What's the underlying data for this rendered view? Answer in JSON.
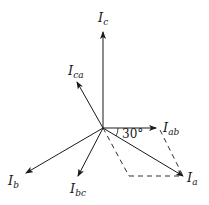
{
  "diagram": {
    "type": "phasor-diagram",
    "origin": [
      103,
      128
    ],
    "vectors": [
      {
        "name": "I_c",
        "main": "I",
        "sub": "c",
        "tip": [
          103,
          32
        ],
        "label_pos": [
          98,
          22
        ]
      },
      {
        "name": "I_ca",
        "main": "I",
        "sub": "ca",
        "tip": [
          77,
          82
        ],
        "label_pos": [
          68,
          75
        ]
      },
      {
        "name": "I_ab",
        "main": "I",
        "sub": "ab",
        "tip": [
          156,
          128
        ],
        "label_pos": [
          163,
          132
        ]
      },
      {
        "name": "I_a",
        "main": "I",
        "sub": "a",
        "tip": [
          183,
          176
        ],
        "label_pos": [
          187,
          182
        ]
      },
      {
        "name": "I_b",
        "main": "I",
        "sub": "b",
        "tip": [
          26,
          173
        ],
        "label_pos": [
          8,
          185
        ]
      },
      {
        "name": "I_bc",
        "main": "I",
        "sub": "bc",
        "tip": [
          78,
          176
        ],
        "label_pos": [
          70,
          193
        ]
      }
    ],
    "angle_label": "30°",
    "dashed_lines": [
      [
        [
          103,
          128
        ],
        [
          129,
          176
        ]
      ],
      [
        [
          129,
          176
        ],
        [
          183,
          176
        ]
      ],
      [
        [
          160,
          130
        ],
        [
          183,
          176
        ]
      ]
    ]
  }
}
